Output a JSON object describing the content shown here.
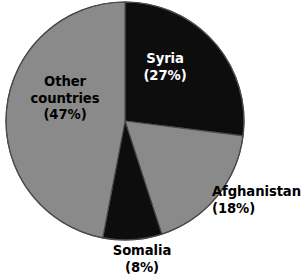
{
  "chart_data": {
    "type": "pie",
    "title": "",
    "subtitle": "",
    "xlabel": "",
    "ylabel": "",
    "legend_position": "none",
    "grid": false,
    "units": "percent",
    "start_angle_deg": 0,
    "direction": "clockwise",
    "categories": [
      "Syria",
      "Afghanistan",
      "Somalia",
      "Other countries"
    ],
    "values": [
      27,
      18,
      8,
      47
    ],
    "slices": [
      {
        "name": "Syria",
        "value": 27,
        "value_label": "(27%)",
        "color": "#0d0d0d",
        "label_color": "#ffffff",
        "label_placement": "inside",
        "start_angle_deg": 0,
        "end_angle_deg": 97.2
      },
      {
        "name": "Afghanistan",
        "value": 18,
        "value_label": "(18%)",
        "color": "#8a8a8a",
        "label_color": "#000000",
        "label_placement": "outside",
        "start_angle_deg": 97.2,
        "end_angle_deg": 162.0
      },
      {
        "name": "Somalia",
        "value": 8,
        "value_label": "(8%)",
        "color": "#0d0d0d",
        "label_color": "#000000",
        "label_placement": "outside",
        "start_angle_deg": 162.0,
        "end_angle_deg": 190.8
      },
      {
        "name": "Other countries",
        "value": 47,
        "value_label": "(47%)",
        "color": "#8a8a8a",
        "label_color": "#000000",
        "label_placement": "inside",
        "start_angle_deg": 190.8,
        "end_angle_deg": 360.0
      }
    ]
  },
  "labels": {
    "syria": {
      "name": "Syria",
      "pct": "(27%)"
    },
    "afghanistan": {
      "name": "Afghanistan",
      "pct": "(18%)"
    },
    "somalia": {
      "name": "Somalia",
      "pct": "(8%)"
    },
    "other": {
      "name_line1": "Other",
      "name_line2": "countries",
      "pct": "(47%)"
    }
  },
  "geometry": {
    "center_x": 125,
    "center_y": 121,
    "radius": 119
  },
  "colors": {
    "dark_slice": "#0d0d0d",
    "light_slice": "#8a8a8a",
    "slice_outline": "#4a4a4a",
    "background": "#ffffff",
    "dark_label_text": "#ffffff",
    "light_label_text": "#000000"
  }
}
